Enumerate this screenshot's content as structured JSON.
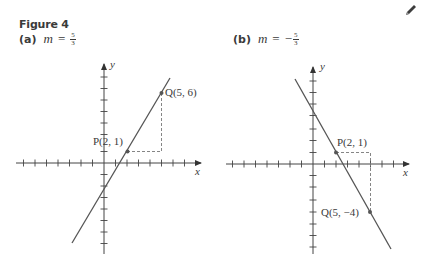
{
  "figure": {
    "title": "Figure 4"
  },
  "toolbar": {
    "edit_icon": "pencil-icon"
  },
  "panels": [
    {
      "tag": "(a)",
      "var": "m",
      "equals": "=",
      "sign": "",
      "numerator": "5",
      "denominator": "3",
      "axis_labels": {
        "x": "x",
        "y": "y"
      },
      "points": [
        {
          "name": "P",
          "label": "P(2, 1)",
          "x": 2,
          "y": 1
        },
        {
          "name": "Q",
          "label": "Q(5, 6)",
          "x": 5,
          "y": 6
        }
      ],
      "slope": "5/3"
    },
    {
      "tag": "(b)",
      "var": "m",
      "equals": "=",
      "sign": "−",
      "numerator": "5",
      "denominator": "3",
      "axis_labels": {
        "x": "x",
        "y": "y"
      },
      "points": [
        {
          "name": "P",
          "label": "P(2, 1)",
          "x": 2,
          "y": 1
        },
        {
          "name": "Q",
          "label": "Q(5, −4)",
          "x": 5,
          "y": -4
        }
      ],
      "slope": "-5/3"
    }
  ],
  "colors": {
    "ink": "#3a3a3a",
    "line": "#555555",
    "dash": "#777777",
    "background": "#ffffff"
  }
}
